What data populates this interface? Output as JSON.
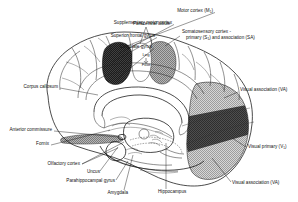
{
  "figure": {
    "background_color": "#ffffff",
    "line_color": "#111111"
  },
  "regions": [
    {
      "id": "motor-cortex",
      "name": "Motor cortex (M1)",
      "fill": "#1c1c1c",
      "pattern": "dark-stipple",
      "description": "dark filled region on superior frontal convexity"
    },
    {
      "id": "somatosensory-cortex",
      "name": "Somatosensory cortex - primary (S1) and association (SA)",
      "fill": "#9a9a9a",
      "pattern": "cross-hatch",
      "description": "mid-gray hatched region posterior to central sulcus"
    },
    {
      "id": "visual-association",
      "name": "Visual association (VA)",
      "fill": "#b8b8b8",
      "pattern": "cross-hatch",
      "description": "light gray hatched occipital region"
    },
    {
      "id": "visual-primary",
      "name": "Visual primary (V1)",
      "fill": "#4a4a4a",
      "pattern": "dark-solid",
      "description": "dark band along calcarine sulcus"
    },
    {
      "id": "olfactory-cortex-band",
      "name": "Olfactory cortex",
      "fill": "#8c8c8c",
      "pattern": "cross-hatch",
      "description": "small hatched band at base of frontal lobe"
    }
  ],
  "labels": [
    {
      "id": "motor-cortex",
      "text": "Motor cortex (M",
      "sub": "1",
      "tail": ")",
      "x": 213,
      "y": 11,
      "anchor": "end",
      "line": [
        [
          215,
          12.5
        ],
        [
          124,
          47
        ]
      ]
    },
    {
      "id": "supplementary-motor",
      "text": "Supplementary motor cortex",
      "sub": "",
      "tail": "",
      "x": 172,
      "y": 23,
      "anchor": "end",
      "line": [
        [
          174,
          24.5
        ],
        [
          118,
          54
        ]
      ]
    },
    {
      "id": "superior-frontal-gyrus",
      "text": "Superior frontal gyrus",
      "sub": "",
      "tail": "",
      "x": 155,
      "y": 36,
      "anchor": "end",
      "line": [
        [
          157,
          37.5
        ],
        [
          112,
          62
        ]
      ]
    },
    {
      "id": "cingulate-gyrus",
      "text": "Cingulate gyrus",
      "sub": "",
      "tail": "",
      "x": 152,
      "y": 47,
      "anchor": "end",
      "line": [
        [
          154,
          48.5
        ],
        [
          116,
          80
        ]
      ]
    },
    {
      "id": "paracentral-lobule",
      "text": "Paracentral lobule",
      "sub": "",
      "tail": "",
      "x": 133,
      "y": 24,
      "anchor": "start",
      "line": [
        [
          146,
          26
        ],
        [
          150,
          42
        ]
      ]
    },
    {
      "id": "somatosensory-cortex",
      "text": "Somatosensory cortex -",
      "sub": "",
      "tail": "",
      "x": 182,
      "y": 33,
      "anchor": "start",
      "line": [
        [
          180,
          36
        ],
        [
          166,
          45
        ]
      ]
    },
    {
      "id": "somatosensory-cortex-2",
      "text": "primary (S",
      "sub": "1",
      "tail": ") and association (SA)",
      "x": 186,
      "y": 39,
      "anchor": "start",
      "line": []
    },
    {
      "id": "corpus-callosum",
      "text": "Corpus callosum",
      "sub": "",
      "tail": "",
      "x": 58,
      "y": 87,
      "anchor": "end",
      "line": [
        [
          60,
          88
        ],
        [
          95,
          92
        ]
      ]
    },
    {
      "id": "anterior-commissure",
      "text": "Anterior commissure",
      "sub": "",
      "tail": "",
      "x": 52,
      "y": 130,
      "anchor": "end",
      "line": [
        [
          54,
          131
        ],
        [
          118,
          138
        ]
      ]
    },
    {
      "id": "fornix",
      "text": "Fornix",
      "sub": "",
      "tail": "",
      "x": 49,
      "y": 144,
      "anchor": "end",
      "line": [
        [
          51,
          145
        ],
        [
          122,
          134
        ]
      ]
    },
    {
      "id": "olfactory-cortex",
      "text": "Olfactory cortex",
      "sub": "",
      "tail": "",
      "x": 80,
      "y": 165,
      "anchor": "end",
      "line": [
        [
          82,
          164
        ],
        [
          126,
          141
        ]
      ]
    },
    {
      "id": "uncus",
      "text": "Uncus",
      "sub": "",
      "tail": "",
      "x": 100,
      "y": 173,
      "anchor": "end",
      "line": [
        [
          100,
          171
        ],
        [
          125,
          143
        ]
      ]
    },
    {
      "id": "parahippocampal-gyrus",
      "text": "Parahippocampal gyrus",
      "sub": "",
      "tail": "",
      "x": 115,
      "y": 182,
      "anchor": "end",
      "line": [
        [
          116,
          180
        ],
        [
          128,
          160
        ]
      ]
    },
    {
      "id": "amygdala",
      "text": "Amygdala",
      "sub": "",
      "tail": "",
      "x": 128,
      "y": 194,
      "anchor": "end",
      "line": [
        [
          124,
          190
        ],
        [
          131,
          163
        ]
      ]
    },
    {
      "id": "hippocampus",
      "text": "Hippocampus",
      "sub": "",
      "tail": "",
      "x": 158,
      "y": 193,
      "anchor": "start",
      "line": [
        [
          166,
          189
        ],
        [
          166,
          140
        ]
      ]
    },
    {
      "id": "visual-association-top",
      "text": "Visual association (VA)",
      "sub": "",
      "tail": "",
      "x": 240,
      "y": 91,
      "anchor": "start",
      "line": [
        [
          238,
          92
        ],
        [
          224,
          98
        ]
      ]
    },
    {
      "id": "visual-primary",
      "text": "Visual primary (V",
      "sub": "1",
      "tail": ")",
      "x": 248,
      "y": 148,
      "anchor": "start",
      "line": [
        [
          246,
          147
        ],
        [
          234,
          140
        ]
      ]
    },
    {
      "id": "visual-association-bot",
      "text": "Visual association (VA)",
      "sub": "",
      "tail": "",
      "x": 232,
      "y": 184,
      "anchor": "start",
      "line": [
        [
          231,
          182
        ],
        [
          214,
          160
        ]
      ]
    }
  ],
  "inner_labels": [
    {
      "id": "leg",
      "text": "Leg",
      "x": 146,
      "y": 56
    },
    {
      "id": "foot",
      "text": "Foot",
      "x": 146,
      "y": 65
    }
  ]
}
